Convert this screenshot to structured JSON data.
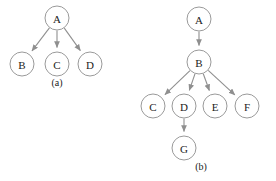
{
  "figure": {
    "type": "diagram",
    "colors": {
      "node_fill": "#ffffff",
      "node_stroke": "#9a9a9a",
      "edge": "#8f8f8f",
      "label_text": "#222222",
      "background": "#ffffff"
    },
    "node_radius": 12
  },
  "subfigures": [
    {
      "id": "a",
      "caption": "(a)",
      "caption_pos": {
        "x": 57,
        "y": 86
      },
      "nodes": [
        {
          "id": "A",
          "label": "A",
          "x": 57,
          "y": 18
        },
        {
          "id": "B",
          "label": "B",
          "x": 22,
          "y": 64
        },
        {
          "id": "C",
          "label": "C",
          "x": 57,
          "y": 64
        },
        {
          "id": "D",
          "label": "D",
          "x": 90,
          "y": 64
        }
      ],
      "edges": [
        {
          "from": "A",
          "to": "B"
        },
        {
          "from": "A",
          "to": "C"
        },
        {
          "from": "A",
          "to": "D"
        }
      ]
    },
    {
      "id": "b",
      "caption": "(b)",
      "caption_pos": {
        "x": 201,
        "y": 170
      },
      "nodes": [
        {
          "id": "A",
          "label": "A",
          "x": 199,
          "y": 19
        },
        {
          "id": "B",
          "label": "B",
          "x": 199,
          "y": 62
        },
        {
          "id": "C",
          "label": "C",
          "x": 153,
          "y": 106
        },
        {
          "id": "D",
          "label": "D",
          "x": 184,
          "y": 106
        },
        {
          "id": "E",
          "label": "E",
          "x": 215,
          "y": 106
        },
        {
          "id": "F",
          "label": "F",
          "x": 247,
          "y": 106
        },
        {
          "id": "G",
          "label": "G",
          "x": 184,
          "y": 148
        }
      ],
      "edges": [
        {
          "from": "A",
          "to": "B"
        },
        {
          "from": "B",
          "to": "C"
        },
        {
          "from": "B",
          "to": "D"
        },
        {
          "from": "B",
          "to": "E"
        },
        {
          "from": "B",
          "to": "F"
        },
        {
          "from": "D",
          "to": "G"
        }
      ]
    }
  ]
}
